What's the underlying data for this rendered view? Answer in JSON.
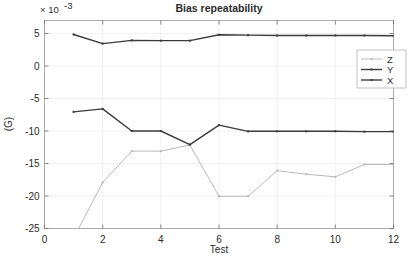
{
  "chart_data": {
    "type": "line",
    "title": "Bias repeatability",
    "xlabel": "Test",
    "ylabel": "(G)",
    "y_multiplier": "× 10",
    "y_multiplier_exponent": "-3",
    "x": [
      1,
      2,
      3,
      4,
      5,
      6,
      7,
      8,
      9,
      10,
      11,
      12
    ],
    "xlim": [
      0,
      12
    ],
    "ylim": [
      -25,
      7
    ],
    "xticks": [
      0,
      2,
      4,
      6,
      8,
      10,
      12
    ],
    "xtick_labels": [
      "0",
      "2",
      "4",
      "6",
      "8",
      "10",
      "12"
    ],
    "yticks": [
      5,
      0,
      -5,
      -10,
      -15,
      -20,
      -25
    ],
    "ytick_labels": [
      "5",
      "0",
      "-5",
      "-10",
      "-15",
      "-20",
      "-25"
    ],
    "grid": true,
    "legend_position": "upper right",
    "series": [
      {
        "name": "Z",
        "color": "#b9b9b9",
        "values": [
          -26.5,
          -17.9,
          -13.1,
          -13.1,
          -12.15,
          -20.05,
          -20.05,
          -16.1,
          -16.65,
          -17.05,
          -15.15,
          -15.15
        ]
      },
      {
        "name": "Y",
        "color": "#3b3b3b",
        "values": [
          -7.05,
          -6.6,
          -10.0,
          -10.0,
          -12.1,
          -9.1,
          -10.05,
          -10.05,
          -10.05,
          -10.05,
          -10.1,
          -10.1
        ]
      },
      {
        "name": "X",
        "color": "#3b3b3b",
        "values": [
          4.85,
          3.45,
          3.95,
          3.9,
          3.9,
          4.8,
          4.75,
          4.7,
          4.7,
          4.7,
          4.7,
          4.65
        ]
      }
    ]
  },
  "legend": {
    "entries": [
      {
        "label": "Z"
      },
      {
        "label": "Y"
      },
      {
        "label": "X"
      }
    ]
  }
}
